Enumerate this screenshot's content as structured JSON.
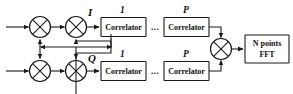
{
  "diagram": {
    "colors": {
      "line": "#1a1a1a",
      "background": "#ffffff",
      "text": "#111111"
    },
    "signal_labels": {
      "i_branch": "I",
      "q_branch": "Q"
    },
    "correlator_indices": {
      "first": "1",
      "last": "P"
    },
    "ellipsis": "...",
    "blocks": {
      "correlator_label": "Correlator",
      "fft_line1": "N points",
      "fft_line2": "FFT"
    },
    "rows": [
      {
        "branch": "I",
        "correlators": [
          {
            "index": "1",
            "label": "Correlator"
          },
          {
            "index": "P",
            "label": "Correlator"
          }
        ]
      },
      {
        "branch": "Q",
        "correlators": [
          {
            "index": "1",
            "label": "Correlator"
          },
          {
            "index": "P",
            "label": "Correlator"
          }
        ]
      }
    ]
  }
}
